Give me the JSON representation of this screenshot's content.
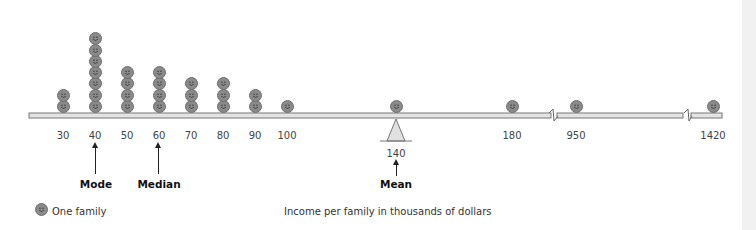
{
  "chart_data": {
    "type": "dot-plot",
    "title": "",
    "xlabel": "Income per family in thousands of dollars",
    "legend": [
      {
        "symbol": "smiley-face",
        "label": "One family"
      }
    ],
    "categories": [
      "30",
      "40",
      "50",
      "60",
      "70",
      "80",
      "90",
      "100",
      "140",
      "180",
      "950",
      "1420"
    ],
    "values": [
      2,
      7,
      4,
      4,
      3,
      3,
      2,
      1,
      1,
      1,
      1,
      1
    ],
    "fulcrum_at": "140",
    "axis_breaks": [
      "between 180 and 950",
      "between 950 and 1420"
    ],
    "annotations": [
      {
        "label": "Mode",
        "at": "40"
      },
      {
        "label": "Median",
        "at": "60"
      },
      {
        "label": "Mean",
        "at": "140"
      }
    ]
  },
  "axis": {
    "ticks": [
      {
        "label": "30",
        "x": 63
      },
      {
        "label": "40",
        "x": 95
      },
      {
        "label": "50",
        "x": 127
      },
      {
        "label": "60",
        "x": 159
      },
      {
        "label": "70",
        "x": 191
      },
      {
        "label": "80",
        "x": 223
      },
      {
        "label": "90",
        "x": 255
      },
      {
        "label": "100",
        "x": 287
      },
      {
        "label": "180",
        "x": 512
      },
      {
        "label": "950",
        "x": 576
      },
      {
        "label": "1420",
        "x": 713
      }
    ],
    "fulcrum_label": "140"
  },
  "annotations": {
    "mode": "Mode",
    "median": "Median",
    "mean": "Mean"
  },
  "legend": {
    "label": "One family"
  },
  "xlabel": "Income per family in thousands of dollars"
}
